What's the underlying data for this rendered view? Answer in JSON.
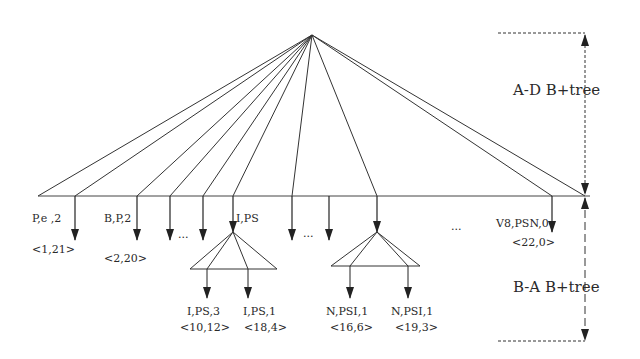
{
  "diagram": {
    "upper_tree_label": "A-D B+tree",
    "lower_tree_label": "B-A B+tree",
    "ellipses": [
      "...",
      "...",
      "..."
    ],
    "root": {
      "x": 312,
      "y": 35
    },
    "baseline": {
      "y": 196,
      "x1": 38,
      "x2": 585
    },
    "fan_endpoints_x": [
      38,
      75,
      137,
      170,
      203,
      233,
      292,
      377,
      552,
      585
    ],
    "leaf_entries": [
      {
        "key": "P,e ,2",
        "pos": "<1,21>"
      },
      {
        "key": "B,P,2",
        "pos": "<2,20>"
      },
      {
        "key": "I,PS",
        "pos": ""
      },
      {
        "key": "V8,PSN,0",
        "pos": "<22,0>"
      }
    ],
    "subtree_entries": [
      {
        "key": "I,PS,3",
        "pos": "<10,12>"
      },
      {
        "key": "I,PS,1",
        "pos": "<18,4>"
      },
      {
        "key": "N,PSI,1",
        "pos": "<16,6>"
      },
      {
        "key": "N,PSI,1",
        "pos": "<19,3>"
      }
    ],
    "colors": {
      "line": "#333333",
      "text": "#2a2a2a",
      "background": "#ffffff"
    }
  }
}
